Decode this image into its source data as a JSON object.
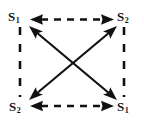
{
  "figure": {
    "background_color": "#ffffff",
    "ink_color": "#111111",
    "width": 144,
    "height": 125
  },
  "nodes": [
    {
      "id": "top-left",
      "symbol": "S",
      "subscript": "1",
      "position": "top-left"
    },
    {
      "id": "top-right",
      "symbol": "S",
      "subscript": "2",
      "position": "top-right"
    },
    {
      "id": "bottom-left",
      "symbol": "S",
      "subscript": "2",
      "position": "bottom-left"
    },
    {
      "id": "bottom-right",
      "symbol": "S",
      "subscript": "1",
      "position": "bottom-right"
    }
  ],
  "edges": [
    {
      "id": "top-edge",
      "from": "top-left",
      "to": "top-right",
      "style": "dashed",
      "arrows": "both",
      "orientation": "horizontal"
    },
    {
      "id": "bottom-edge",
      "from": "bottom-left",
      "to": "bottom-right",
      "style": "dashed",
      "arrows": "both",
      "orientation": "horizontal"
    },
    {
      "id": "left-edge",
      "from": "top-left",
      "to": "bottom-left",
      "style": "dashed",
      "arrows": "none",
      "orientation": "vertical"
    },
    {
      "id": "right-edge",
      "from": "top-right",
      "to": "bottom-right",
      "style": "dashed",
      "arrows": "none",
      "orientation": "vertical"
    },
    {
      "id": "diagonal-tl-br",
      "from": "top-left",
      "to": "bottom-right",
      "style": "solid",
      "arrows": "both",
      "orientation": "diagonal"
    },
    {
      "id": "diagonal-tr-bl",
      "from": "top-right",
      "to": "bottom-left",
      "style": "solid",
      "arrows": "both",
      "orientation": "diagonal"
    }
  ]
}
